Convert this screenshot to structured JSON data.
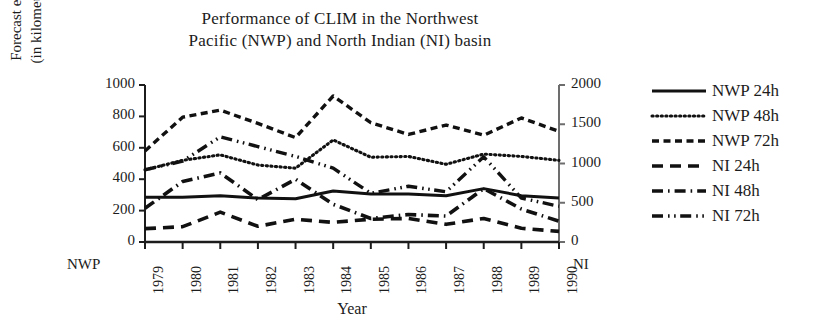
{
  "title": {
    "line1": "Performance of CLIM in the Northwest",
    "line2": "Pacific (NWP) and North Indian (NI) basin"
  },
  "axes": {
    "y_left_label_line1": "Forecast error",
    "y_left_label_line2": "(in kilometres)",
    "x_label": "Year",
    "left_corner_label": "NWP",
    "right_corner_label": "NI"
  },
  "legend": {
    "items": [
      {
        "label": "NWP 24h",
        "style": "solid"
      },
      {
        "label": "NWP 48h",
        "style": "dotted"
      },
      {
        "label": "NWP 72h",
        "style": "dashed"
      },
      {
        "label": "NI 24h",
        "style": "longdash"
      },
      {
        "label": "NI 48h",
        "style": "dashdot"
      },
      {
        "label": "NI 72h",
        "style": "dashdotdot"
      }
    ]
  },
  "chart_data": {
    "type": "line",
    "title": "Performance of CLIM in the Northwest Pacific (NWP) and North Indian (NI) basin",
    "xlabel": "Year",
    "ylabel": "Forecast error (in kilometres)",
    "ylabel_right": "Forecast error (in kilometres)",
    "x": [
      1979,
      1980,
      1981,
      1982,
      1983,
      1984,
      1985,
      1986,
      1987,
      1988,
      1989,
      1990
    ],
    "xtick_labels": [
      "1979",
      "1980",
      "1981",
      "1982",
      "1983",
      "1984",
      "1985",
      "1986",
      "1987",
      "1988",
      "1989",
      "1990"
    ],
    "ylim": [
      0,
      1000
    ],
    "yticks": [
      0,
      200,
      400,
      600,
      800,
      1000
    ],
    "ylim_right": [
      0,
      2000
    ],
    "yticks_right": [
      0,
      500,
      1000,
      1500,
      2000
    ],
    "grid": false,
    "legend_position": "right",
    "left_axis_group": "NWP",
    "right_axis_group": "NI",
    "series": [
      {
        "name": "NWP 24h",
        "axis": "left",
        "style": "solid",
        "values": [
          285,
          285,
          295,
          280,
          275,
          325,
          305,
          305,
          295,
          340,
          295,
          280
        ]
      },
      {
        "name": "NWP 48h",
        "axis": "left",
        "style": "dotted",
        "values": [
          460,
          520,
          555,
          490,
          470,
          650,
          540,
          545,
          495,
          560,
          545,
          520
        ]
      },
      {
        "name": "NWP 72h",
        "axis": "left",
        "style": "dashed",
        "values": [
          580,
          795,
          840,
          755,
          665,
          930,
          760,
          685,
          745,
          680,
          790,
          705
        ]
      },
      {
        "name": "NI 24h",
        "axis": "right",
        "style": "longdash",
        "values": [
          170,
          195,
          380,
          200,
          290,
          250,
          290,
          300,
          225,
          300,
          175,
          135
        ]
      },
      {
        "name": "NI 48h",
        "axis": "right",
        "style": "dashdot",
        "values": [
          430,
          770,
          880,
          540,
          800,
          480,
          300,
          350,
          330,
          680,
          420,
          265
        ]
      },
      {
        "name": "NI 72h",
        "axis": "right",
        "style": "dashdotdot",
        "values": [
          920,
          1030,
          1340,
          1215,
          1090,
          940,
          620,
          710,
          640,
          1085,
          560,
          455
        ]
      }
    ]
  },
  "geometry": {
    "plot_left": 145,
    "plot_right": 559,
    "plot_top": 85,
    "plot_bottom": 242
  }
}
